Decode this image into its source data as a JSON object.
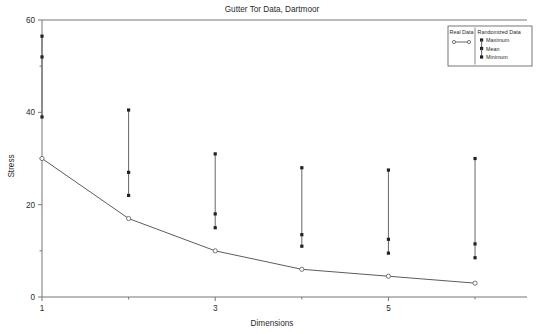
{
  "chart_data": {
    "type": "line",
    "title": "Gutter Tor Data, Dartmoor",
    "xlabel": "Dimensions",
    "ylabel": "Stress",
    "xlim": [
      1,
      6.6
    ],
    "ylim": [
      0,
      60
    ],
    "grid": false,
    "x_major_ticks": [
      1,
      3,
      5
    ],
    "x_major_tick_labels": [
      "1",
      "3",
      "5"
    ],
    "x_minor_ticks": [
      2,
      4,
      6
    ],
    "y_major_ticks": [
      0,
      20,
      40,
      60
    ],
    "y_major_tick_labels": [
      "0",
      "20",
      "40",
      "60"
    ],
    "y_minor_ticks": [
      10,
      30,
      50
    ],
    "x": [
      1,
      2,
      3,
      4,
      5,
      6
    ],
    "series": [
      {
        "name": "Real Data",
        "kind": "line-with-open-markers",
        "values": [
          30.0,
          17.0,
          10.0,
          6.0,
          4.5,
          3.0
        ]
      },
      {
        "name": "Maximum",
        "kind": "error-top",
        "values": [
          56.5,
          40.5,
          31.0,
          28.0,
          27.5,
          30.0
        ]
      },
      {
        "name": "Mean",
        "kind": "error-mid",
        "values": [
          52.0,
          27.0,
          18.0,
          13.5,
          12.5,
          11.5
        ]
      },
      {
        "name": "Minimum",
        "kind": "error-bottom",
        "values": [
          39.0,
          22.0,
          15.0,
          11.0,
          9.5,
          8.5
        ]
      }
    ],
    "legend_position": "top-right",
    "legend": {
      "col1_header": "Real Data",
      "col2_header": "Randomized Data",
      "entries": [
        "Maximum",
        "Mean",
        "Minimum"
      ]
    },
    "colors": {
      "line": "#4a4a4a",
      "marker": "#222222",
      "frame": "#777777",
      "background": "#ffffff"
    }
  }
}
